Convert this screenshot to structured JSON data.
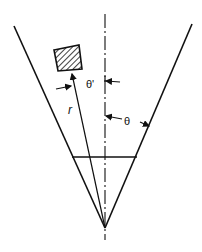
{
  "diagram": {
    "type": "cone-geometry",
    "stroke_color": "#111111",
    "background": "#ffffff",
    "labels": {
      "theta_prime": "θ'",
      "theta": "θ",
      "radius": "r"
    },
    "elements": {
      "cone_left_edge": "left boundary line",
      "cone_right_edge": "right boundary line",
      "axis": "dash-dot center axis",
      "object": "hatched square",
      "radius_line": "line from apex to object",
      "cross_section": "horizontal chord"
    }
  }
}
